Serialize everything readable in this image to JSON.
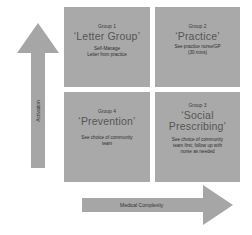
{
  "colors": {
    "box_fill": "#a9a9a9",
    "arrow_fill": "#a6a6a6",
    "text": "#3a3a3a"
  },
  "axes": {
    "vertical": {
      "label": "Activation",
      "direction": "up"
    },
    "horizontal": {
      "label": "Medical Complexity",
      "direction": "right"
    }
  },
  "quadrants": [
    {
      "position": "top-left",
      "group": "Group 1",
      "title": "‘Letter Group’",
      "description": [
        "Self-Manage",
        "Letter from practice"
      ]
    },
    {
      "position": "top-right",
      "group": "Group 2",
      "title": "‘Practice’",
      "description": [
        "See practice nurse/GP",
        "(30 mins)"
      ]
    },
    {
      "position": "bottom-left",
      "group": "Group 4",
      "title": "‘Prevention’",
      "description": [
        "See choice of community",
        "team"
      ]
    },
    {
      "position": "bottom-right",
      "group": "Group 3",
      "title_lines": [
        "‘Social",
        "Prescribing’"
      ],
      "description": [
        "See choice of community",
        "team first; follow up with",
        "nurse as needed"
      ]
    }
  ]
}
